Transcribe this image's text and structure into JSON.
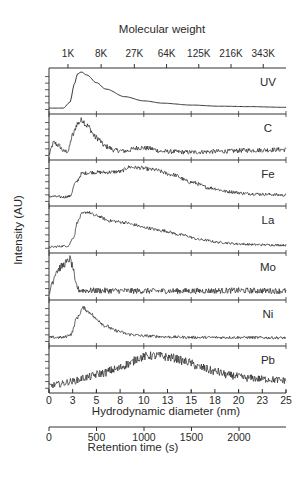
{
  "chart_data": {
    "type": "line",
    "layout": "stacked-panels",
    "title": "",
    "top_axis": {
      "label": "Molecular weight",
      "tick_labels": [
        "1K",
        "8K",
        "27K",
        "64K",
        "125K",
        "216K",
        "343K"
      ],
      "tick_diameters_nm": [
        2.0,
        5.5,
        9.0,
        12.4,
        15.8,
        19.2,
        22.6
      ]
    },
    "xlabel": "Hydrodynamic diameter (nm)",
    "xlim": [
      0,
      25
    ],
    "x_tick_labels": [
      "0",
      "3",
      "5",
      "8",
      "10",
      "13",
      "15",
      "18",
      "20",
      "23",
      "25"
    ],
    "x_ticks": [
      0,
      2.5,
      5,
      7.5,
      10,
      12.5,
      15,
      17.5,
      20,
      22.5,
      25
    ],
    "secondary_x_axis": {
      "label": "Retention time (s)",
      "tick_labels": [
        "0",
        "500",
        "1000",
        "1500",
        "2000"
      ],
      "ticks": [
        0,
        500,
        1000,
        1500,
        2000
      ]
    },
    "ylabel": "Intensity (AU)",
    "grid": false,
    "series": [
      {
        "name": "UV",
        "noise": 0.0,
        "x": [
          0,
          1.5,
          2.2,
          2.7,
          3.0,
          3.4,
          4.0,
          5.0,
          6.0,
          8.0,
          10,
          12,
          15,
          18,
          21,
          25
        ],
        "y": [
          0.05,
          0.05,
          0.2,
          0.7,
          0.95,
          1.0,
          0.92,
          0.72,
          0.55,
          0.35,
          0.24,
          0.18,
          0.13,
          0.1,
          0.09,
          0.07
        ]
      },
      {
        "name": "C",
        "noise": 0.08,
        "x": [
          0,
          0.5,
          1.0,
          1.6,
          2.0,
          2.5,
          3.0,
          3.5,
          4.0,
          5.0,
          6.0,
          7.0,
          8.0,
          9.5,
          10.5,
          12,
          15,
          18,
          21,
          25
        ],
        "y": [
          0.05,
          0.35,
          0.28,
          0.12,
          0.13,
          0.55,
          0.85,
          0.95,
          0.8,
          0.48,
          0.25,
          0.15,
          0.13,
          0.22,
          0.2,
          0.12,
          0.1,
          0.12,
          0.15,
          0.17
        ]
      },
      {
        "name": "Fe",
        "noise": 0.05,
        "x": [
          0,
          1.5,
          2.2,
          2.8,
          3.5,
          4.5,
          6.0,
          7.5,
          8.5,
          9.5,
          11,
          13,
          15,
          17,
          19,
          21,
          23,
          25
        ],
        "y": [
          0.15,
          0.13,
          0.15,
          0.5,
          0.75,
          0.78,
          0.78,
          0.8,
          0.92,
          0.9,
          0.85,
          0.72,
          0.52,
          0.37,
          0.27,
          0.22,
          0.2,
          0.18
        ]
      },
      {
        "name": "La",
        "noise": 0.04,
        "x": [
          0,
          2.0,
          2.6,
          3.0,
          3.5,
          4.0,
          5.0,
          6.5,
          8.0,
          9.0,
          10,
          12,
          14,
          16,
          18,
          20,
          22,
          25
        ],
        "y": [
          0.05,
          0.08,
          0.3,
          0.7,
          0.9,
          0.95,
          0.85,
          0.72,
          0.68,
          0.62,
          0.55,
          0.47,
          0.36,
          0.24,
          0.17,
          0.13,
          0.11,
          0.1
        ]
      },
      {
        "name": "Mo",
        "noise": 0.1,
        "x": [
          0,
          0.3,
          0.8,
          1.3,
          1.8,
          2.2,
          2.5,
          2.8,
          3.2,
          4,
          10,
          15,
          20,
          25
        ],
        "y": [
          0.0,
          0.35,
          0.65,
          0.75,
          0.85,
          0.95,
          0.75,
          0.3,
          0.15,
          0.14,
          0.13,
          0.13,
          0.14,
          0.13
        ]
      },
      {
        "name": "Ni",
        "noise": 0.05,
        "x": [
          0,
          1.5,
          2.3,
          3.0,
          3.6,
          4.3,
          5.0,
          6.0,
          7.0,
          8.5,
          10,
          13,
          16,
          20,
          25
        ],
        "y": [
          0.12,
          0.12,
          0.2,
          0.65,
          0.9,
          0.78,
          0.6,
          0.42,
          0.3,
          0.2,
          0.16,
          0.13,
          0.12,
          0.12,
          0.11
        ]
      },
      {
        "name": "Pb",
        "noise": 0.11,
        "x": [
          0,
          1.0,
          2.5,
          4.0,
          5.5,
          7.0,
          8.5,
          9.5,
          10.5,
          11.5,
          13,
          14.5,
          16,
          17.5,
          19,
          21,
          23,
          25
        ],
        "y": [
          0.08,
          0.12,
          0.2,
          0.3,
          0.4,
          0.5,
          0.65,
          0.8,
          0.85,
          0.85,
          0.8,
          0.7,
          0.55,
          0.45,
          0.35,
          0.28,
          0.25,
          0.22
        ]
      }
    ]
  },
  "labels": {
    "top_axis_title": "Molecular weight",
    "y_axis_title": "Intensity (AU)",
    "x_axis_title": "Hydrodynamic diameter (nm)",
    "retention_axis_title": "Retention time (s)"
  }
}
